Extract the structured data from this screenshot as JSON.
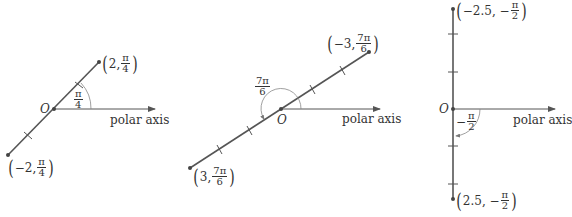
{
  "diagrams": [
    {
      "origin_label": "O",
      "axis_label": "polar axis",
      "angle": {
        "num": "π",
        "den": "4"
      },
      "point_positive": {
        "r": "2,",
        "num": "π",
        "den": "4"
      },
      "point_negative": {
        "r": "−2,",
        "num": "π",
        "den": "4"
      }
    },
    {
      "origin_label": "O",
      "axis_label": "polar axis",
      "angle": {
        "num": "7π",
        "den": "6"
      },
      "point_upper": {
        "r": "−3,",
        "num": "7π",
        "den": "6"
      },
      "point_lower": {
        "r": "3,",
        "num": "7π",
        "den": "6"
      }
    },
    {
      "origin_label": "O",
      "axis_label": "polar axis",
      "angle": {
        "sign": "−",
        "num": "π",
        "den": "2"
      },
      "point_upper": {
        "r": "−2.5, −",
        "num": "π",
        "den": "2"
      },
      "point_lower": {
        "r": "2.5, −",
        "num": "π",
        "den": "2"
      }
    }
  ],
  "colors": {
    "line": "#555555",
    "arc": "#777777",
    "text": "#333333"
  }
}
